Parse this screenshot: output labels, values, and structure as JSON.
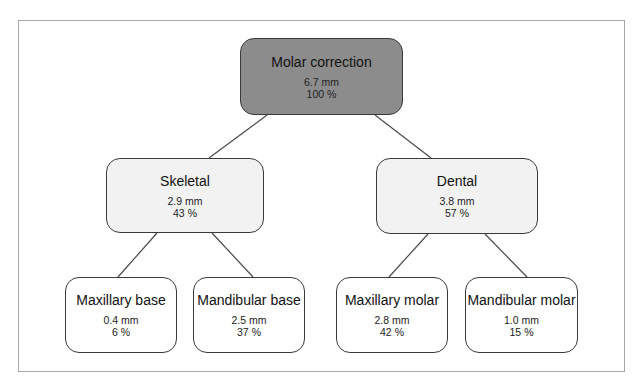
{
  "diagram": {
    "type": "tree",
    "root": {
      "title": "Molar correction",
      "value": "6.7 mm",
      "percent": "100 %"
    },
    "level1": [
      {
        "title": "Skeletal",
        "value": "2.9 mm",
        "percent": "43 %"
      },
      {
        "title": "Dental",
        "value": "3.8 mm",
        "percent": "57 %"
      }
    ],
    "level2": [
      {
        "parent": "Skeletal",
        "title": "Maxillary base",
        "value": "0.4 mm",
        "percent": "6 %"
      },
      {
        "parent": "Skeletal",
        "title": "Mandibular base",
        "value": "2.5 mm",
        "percent": "37 %"
      },
      {
        "parent": "Dental",
        "title": "Maxillary molar",
        "value": "2.8 mm",
        "percent": "42 %"
      },
      {
        "parent": "Dental",
        "title": "Mandibular molar",
        "value": "1.0 mm",
        "percent": "15 %"
      }
    ],
    "colors": {
      "root_fill": "#8c8c8c",
      "mid_fill": "#f2f2f2",
      "leaf_fill": "#ffffff",
      "border": "#3a3a3a",
      "frame": "#a8a8a8"
    }
  }
}
